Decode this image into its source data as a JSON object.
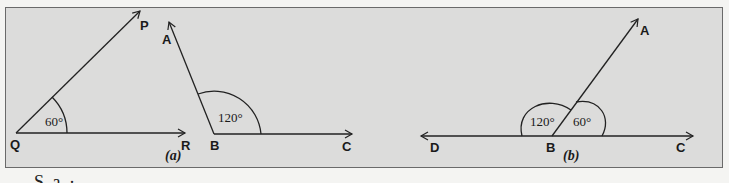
{
  "figure_a": {
    "caption": "(a)",
    "angle1": {
      "vertex": "Q",
      "ray1_end": "P",
      "ray2_end": "R",
      "measure": "60°"
    },
    "angle2": {
      "vertex": "B",
      "ray1_end": "A",
      "ray2_end": "C",
      "measure": "120°"
    }
  },
  "figure_b": {
    "caption": "(b)",
    "points": {
      "left": "D",
      "vertex": "B",
      "right": "C",
      "top": "A"
    },
    "angle_left": "120°",
    "angle_right": "60°"
  },
  "below_text": "S  a  ·"
}
